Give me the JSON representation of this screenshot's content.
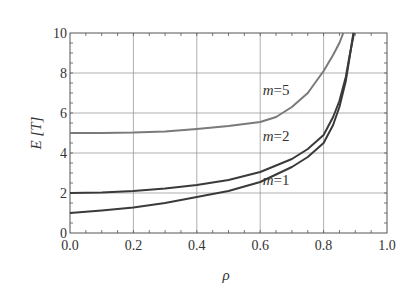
{
  "chart_data": {
    "type": "line",
    "title": "",
    "xlabel": "ρ",
    "ylabel": "E [T]",
    "xlim": [
      0.0,
      1.0
    ],
    "ylim": [
      0,
      10
    ],
    "xticks": [
      "0.0",
      "0.2",
      "0.4",
      "0.6",
      "0.8",
      "1.0"
    ],
    "yticks": [
      "0",
      "2",
      "4",
      "6",
      "8",
      "10"
    ],
    "grid": true,
    "legend": "inline labels",
    "series": [
      {
        "name": "m=1",
        "color": "#3a3a3a",
        "x": [
          0.0,
          0.1,
          0.2,
          0.3,
          0.4,
          0.5,
          0.6,
          0.7,
          0.75,
          0.8,
          0.83,
          0.85,
          0.87,
          0.88,
          0.894
        ],
        "y": [
          1.0,
          1.12,
          1.27,
          1.5,
          1.8,
          2.1,
          2.55,
          3.3,
          3.8,
          4.5,
          5.4,
          6.3,
          7.6,
          8.6,
          10.0
        ]
      },
      {
        "name": "m=2",
        "color": "#3a3a3a",
        "x": [
          0.0,
          0.1,
          0.2,
          0.3,
          0.4,
          0.5,
          0.6,
          0.7,
          0.75,
          0.8,
          0.83,
          0.85,
          0.87,
          0.88,
          0.896
        ],
        "y": [
          2.0,
          2.03,
          2.1,
          2.22,
          2.4,
          2.65,
          3.05,
          3.7,
          4.2,
          4.9,
          5.8,
          6.6,
          7.8,
          8.7,
          10.0
        ]
      },
      {
        "name": "m=5",
        "color": "#7a7a7a",
        "x": [
          0.0,
          0.1,
          0.2,
          0.3,
          0.4,
          0.5,
          0.6,
          0.65,
          0.7,
          0.75,
          0.8,
          0.83,
          0.85,
          0.862
        ],
        "y": [
          5.0,
          5.0,
          5.02,
          5.08,
          5.2,
          5.35,
          5.55,
          5.8,
          6.3,
          7.0,
          8.1,
          8.9,
          9.5,
          10.0
        ]
      }
    ],
    "annotations": [
      {
        "text_var": "m",
        "text_val": "=5",
        "x": 0.65,
        "y": 6.9
      },
      {
        "text_var": "m",
        "text_val": "=2",
        "x": 0.65,
        "y": 4.6
      },
      {
        "text_var": "m",
        "text_val": "=1",
        "x": 0.65,
        "y": 2.4
      }
    ]
  }
}
